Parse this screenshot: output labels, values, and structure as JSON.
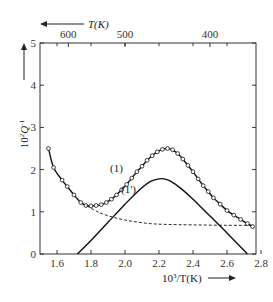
{
  "chart_data": {
    "type": "line",
    "title": "",
    "xlabel": "10^3/T(K)",
    "xlabel_parts": {
      "base": "10",
      "sup": "3",
      "rest": "/T(K)"
    },
    "ylabel": "10^2 Q^-1",
    "ylabel_parts": {
      "base": "10",
      "sup1": "2",
      "mid": "Q",
      "sup2": "-1"
    },
    "top_axis_label": "T(K)",
    "xlim": [
      1.5,
      2.8
    ],
    "ylim": [
      0,
      5
    ],
    "grid": false,
    "x_ticks": [
      1.6,
      1.8,
      2.0,
      2.2,
      2.4,
      2.6,
      2.8
    ],
    "x_tick_labels": [
      "1.6",
      "1.8",
      "2.0",
      "2.2",
      "2.4",
      "2.6",
      "2.8"
    ],
    "y_ticks": [
      0,
      1,
      2,
      3,
      4,
      5
    ],
    "y_tick_labels": [
      "0",
      "1",
      "2",
      "3",
      "4",
      "5"
    ],
    "top_ticks": [
      600,
      500,
      400
    ],
    "top_tick_labels": [
      "600",
      "500",
      "400"
    ],
    "annotations": [
      {
        "text": "(1)",
        "x": 1.95,
        "y": 1.95
      },
      {
        "text": "(1')",
        "x": 2.02,
        "y": 1.45
      }
    ],
    "series": [
      {
        "name": "(1) measured",
        "style": "solid-with-circles",
        "x": [
          1.55,
          1.58,
          1.63,
          1.66,
          1.7,
          1.74,
          1.77,
          1.8,
          1.83,
          1.86,
          1.89,
          1.92,
          1.95,
          1.98,
          2.01,
          2.04,
          2.07,
          2.1,
          2.13,
          2.16,
          2.19,
          2.22,
          2.25,
          2.28,
          2.31,
          2.34,
          2.37,
          2.4,
          2.43,
          2.46,
          2.49,
          2.52,
          2.56,
          2.6,
          2.64,
          2.68,
          2.72,
          2.75
        ],
        "y": [
          2.5,
          2.05,
          1.75,
          1.6,
          1.4,
          1.22,
          1.15,
          1.14,
          1.15,
          1.17,
          1.22,
          1.3,
          1.4,
          1.52,
          1.65,
          1.8,
          1.95,
          2.08,
          2.22,
          2.33,
          2.42,
          2.48,
          2.5,
          2.47,
          2.38,
          2.25,
          2.1,
          1.95,
          1.78,
          1.62,
          1.48,
          1.33,
          1.18,
          1.03,
          0.92,
          0.82,
          0.72,
          0.65
        ]
      },
      {
        "name": "background",
        "style": "dashed",
        "x": [
          1.75,
          1.85,
          1.95,
          2.05,
          2.15,
          2.25,
          2.4,
          2.6,
          2.75
        ],
        "y": [
          1.2,
          0.98,
          0.85,
          0.77,
          0.72,
          0.7,
          0.69,
          0.68,
          0.68
        ]
      },
      {
        "name": "(1') peak",
        "style": "solid",
        "x": [
          1.72,
          1.8,
          1.9,
          2.0,
          2.08,
          2.15,
          2.2,
          2.23,
          2.27,
          2.33,
          2.4,
          2.5,
          2.6,
          2.72
        ],
        "y": [
          0.0,
          0.32,
          0.75,
          1.18,
          1.5,
          1.72,
          1.78,
          1.78,
          1.72,
          1.55,
          1.3,
          0.9,
          0.5,
          0.0
        ]
      }
    ]
  }
}
